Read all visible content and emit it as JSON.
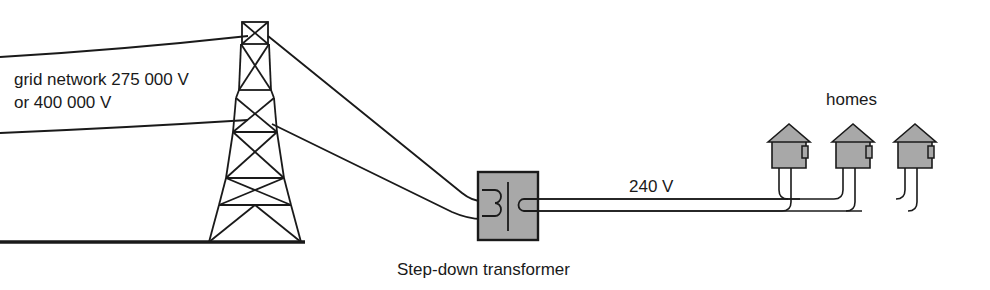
{
  "diagram": {
    "colors": {
      "line": "#1a1a1a",
      "fill_gray": "#a8a8a8",
      "background": "#ffffff",
      "text": "#1a1a1a"
    },
    "labels": {
      "grid_line1": "grid network 275 000 V",
      "grid_line2": "or 400 000 V",
      "low_voltage": "240 V",
      "homes": "homes",
      "transformer_caption": "Step-down transformer"
    },
    "components": {
      "pylon": "transmission-pylon",
      "transformer": "step-down-transformer",
      "houses_count": 3,
      "ground": "ground-line"
    }
  }
}
